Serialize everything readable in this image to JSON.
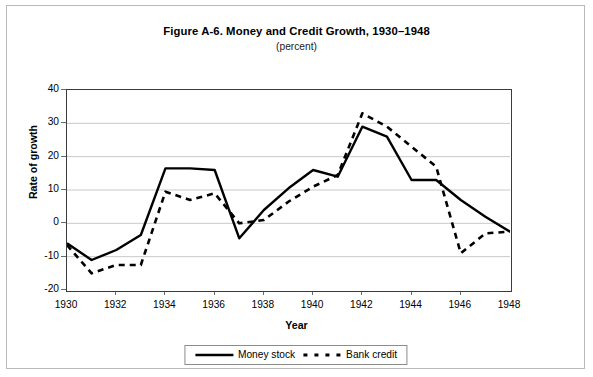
{
  "chart_data": {
    "type": "line",
    "title": "Figure A-6. Money and Credit Growth, 1930–1948",
    "subtitle": "(percent)",
    "xlabel": "Year",
    "ylabel": "Rate of growth",
    "grid": true,
    "legend_position": "bottom",
    "xlim": [
      1930,
      1948
    ],
    "ylim": [
      -20,
      40
    ],
    "y_ticks": [
      40,
      30,
      20,
      10,
      0,
      -10,
      -20
    ],
    "x_ticks": [
      1930,
      1932,
      1934,
      1936,
      1938,
      1940,
      1942,
      1944,
      1946,
      1948
    ],
    "x": [
      1930,
      1931,
      1932,
      1933,
      1934,
      1935,
      1936,
      1937,
      1938,
      1939,
      1940,
      1941,
      1942,
      1943,
      1944,
      1945,
      1946,
      1947,
      1948
    ],
    "series": [
      {
        "name": "Money stock",
        "style": "solid",
        "color": "#000000",
        "values": [
          -6.0,
          -11.0,
          -8.0,
          -3.5,
          16.5,
          16.5,
          16.0,
          -4.5,
          4.0,
          10.5,
          16.0,
          14.0,
          29.0,
          26.0,
          13.0,
          13.0,
          7.0,
          2.0,
          -2.5
        ]
      },
      {
        "name": "Bank credit",
        "style": "dashed",
        "color": "#000000",
        "values": [
          -6.5,
          -15.0,
          -12.5,
          -12.5,
          9.5,
          7.0,
          9.0,
          0.0,
          1.0,
          6.5,
          11.0,
          14.5,
          33.0,
          29.0,
          23.0,
          17.0,
          -9.0,
          -3.0,
          -2.5
        ]
      }
    ]
  },
  "axis": {
    "y_tick_labels": [
      "40",
      "30",
      "20",
      "10",
      "0",
      "-10",
      "-20"
    ],
    "x_tick_labels": [
      "1930",
      "1932",
      "1934",
      "1936",
      "1938",
      "1940",
      "1942",
      "1944",
      "1946",
      "1948"
    ]
  },
  "legend": {
    "items": [
      {
        "label": "Money stock",
        "style": "solid"
      },
      {
        "label": "Bank credit",
        "style": "dashed"
      }
    ]
  },
  "colors": {
    "line": "#000000",
    "grid": "#c9c9c9",
    "frame": "#3b3b3b",
    "outer_border": "#b9b9b9",
    "background": "#ffffff"
  }
}
